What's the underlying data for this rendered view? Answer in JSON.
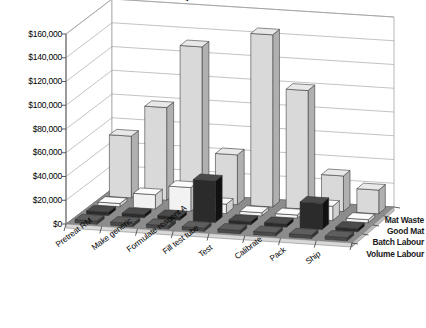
{
  "chart": {
    "title": "Activity Cost Breakdown",
    "currency_prefix": "$"
  },
  "axis": {
    "y_ticks": [
      "$160,000",
      "$140,000",
      "$120,000",
      "$100,000",
      "$80,000",
      "$60,000",
      "$40,000",
      "$20,000",
      "$0"
    ],
    "y_tick_values": [
      160000,
      140000,
      120000,
      100000,
      80000,
      60000,
      40000,
      20000,
      0
    ]
  },
  "series_labels": [
    "Mat Waste",
    "Good Mat",
    "Batch Labour",
    "Volume Labour"
  ],
  "categories": [
    "Pretreat RM",
    "Make generic",
    "Formulate reagent A",
    "Fill test tube",
    "Test",
    "Calibrate",
    "Pack",
    "Ship"
  ],
  "colors": {
    "mat_waste": "#d9d9d9",
    "good_mat": "#f2f2f2",
    "batch_labour": "#2b2b2b",
    "volume_labour": "#4a4a4a",
    "floor": "#8c8c8c",
    "wall": "#ffffff",
    "gridline": "#9a9a9a",
    "axis": "#6e6e6e",
    "text": "#000000"
  },
  "chart_data": {
    "type": "bar",
    "title": "Activity Cost Breakdown",
    "xlabel": "",
    "ylabel": "",
    "ylim": [
      0,
      160000
    ],
    "grid": true,
    "legend_position": "right-depth-axis",
    "three_d": true,
    "categories": [
      "Pretreat RM",
      "Make generic",
      "Formulate reagent A",
      "Fill test tube",
      "Test",
      "Calibrate",
      "Pack",
      "Ship"
    ],
    "series": [
      {
        "name": "Mat Waste",
        "values": [
          52000,
          78000,
          131000,
          42000,
          145000,
          100000,
          30000,
          20000
        ]
      },
      {
        "name": "Good Mat",
        "values": [
          0,
          12000,
          20000,
          8000,
          0,
          0,
          12000,
          0
        ]
      },
      {
        "name": "Batch Labour",
        "values": [
          0,
          0,
          0,
          35000,
          0,
          0,
          22000,
          0
        ]
      },
      {
        "name": "Volume Labour",
        "values": [
          0,
          0,
          0,
          0,
          0,
          0,
          0,
          0
        ]
      }
    ]
  }
}
